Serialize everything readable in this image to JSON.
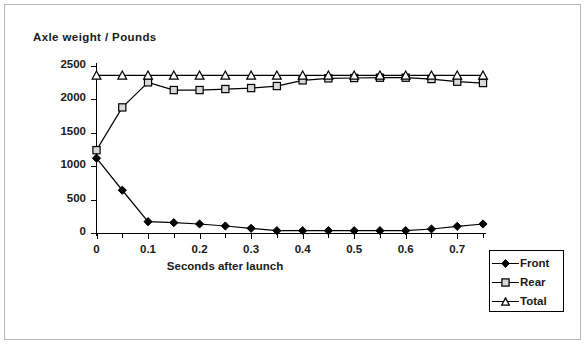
{
  "chart_data": {
    "type": "line",
    "title": "Axle weight / Pounds",
    "xlabel": "Seconds after launch",
    "ylabel": "Axle weight / Pounds",
    "xlim": [
      0,
      0.775
    ],
    "ylim": [
      0,
      2500
    ],
    "grid": false,
    "legend_position": "bottom-right-outside",
    "x_tick_step": 0.05,
    "x_label_step": 0.1,
    "y_tick_step": 500,
    "x_tick_labels": [
      "0",
      "0.1",
      "0.2",
      "0.3",
      "0.4",
      "0.5",
      "0.6",
      "0.7"
    ],
    "x_tick_label_values": [
      0,
      0.1,
      0.2,
      0.3,
      0.4,
      0.5,
      0.6,
      0.7
    ],
    "y_tick_labels": [
      "0",
      "500",
      "1000",
      "1500",
      "2000",
      "2500"
    ],
    "y_tick_values": [
      0,
      500,
      1000,
      1500,
      2000,
      2500
    ],
    "x": [
      0,
      0.05,
      0.1,
      0.15,
      0.2,
      0.25,
      0.3,
      0.35,
      0.4,
      0.45,
      0.5,
      0.55,
      0.6,
      0.65,
      0.7,
      0.75
    ],
    "series": [
      {
        "name": "Front",
        "marker": "filled-diamond",
        "values": [
          1120,
          640,
          170,
          155,
          135,
          105,
          70,
          35,
          35,
          35,
          35,
          35,
          35,
          60,
          100,
          135
        ]
      },
      {
        "name": "Rear",
        "marker": "open-square",
        "values": [
          1240,
          1880,
          2255,
          2140,
          2140,
          2155,
          2170,
          2200,
          2285,
          2315,
          2320,
          2325,
          2325,
          2305,
          2265,
          2245
        ]
      },
      {
        "name": "Total",
        "marker": "open-triangle",
        "values": [
          2360,
          2360,
          2360,
          2360,
          2360,
          2360,
          2360,
          2360,
          2360,
          2360,
          2360,
          2360,
          2360,
          2360,
          2360,
          2360
        ]
      }
    ]
  },
  "legend": {
    "entries": [
      {
        "label": "Front",
        "marker": "filled-diamond"
      },
      {
        "label": "Rear",
        "marker": "open-square"
      },
      {
        "label": "Total",
        "marker": "open-triangle"
      }
    ]
  },
  "colors": {
    "line": "#000000",
    "marker_fill_front": "#000000",
    "marker_fill_rear": "#d9d9d9",
    "marker_fill_total": "#ffffff",
    "background": "#ffffff",
    "frame": "#b9b9b9"
  }
}
